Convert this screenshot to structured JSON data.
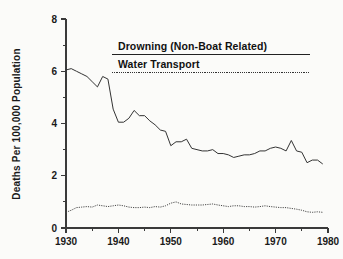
{
  "chart_data": {
    "type": "line",
    "title": "",
    "subtitle": "",
    "xlabel": "",
    "ylabel": "Deaths Per 100,000 Population",
    "xlim": [
      1930,
      1980
    ],
    "ylim": [
      0,
      8
    ],
    "grid": false,
    "legend_position": "upper-center",
    "x_ticks_major": [
      1930,
      1940,
      1950,
      1960,
      1970,
      1980
    ],
    "x_tick_labels": [
      "1930",
      "1940",
      "1950",
      "1960",
      "1970",
      "1980"
    ],
    "x_ticks_minor": [
      1935,
      1945,
      1955,
      1965,
      1975
    ],
    "y_ticks_major": [
      0,
      2,
      4,
      6,
      8
    ],
    "y_tick_labels": [
      "0",
      "2",
      "4",
      "6",
      "8"
    ],
    "y_ticks_minor": [
      1,
      3,
      5,
      7
    ],
    "x": [
      1930,
      1931,
      1932,
      1933,
      1934,
      1935,
      1936,
      1937,
      1938,
      1939,
      1940,
      1941,
      1942,
      1943,
      1944,
      1945,
      1946,
      1947,
      1948,
      1949,
      1950,
      1951,
      1952,
      1953,
      1954,
      1955,
      1956,
      1957,
      1958,
      1959,
      1960,
      1961,
      1962,
      1963,
      1964,
      1965,
      1966,
      1967,
      1968,
      1969,
      1970,
      1971,
      1972,
      1973,
      1974,
      1975,
      1976,
      1977,
      1978,
      1979
    ],
    "series": [
      {
        "name": "Drowning (Non-Boat Related)",
        "style": "solid",
        "color": "#333333",
        "values": [
          6.05,
          6.1,
          6.0,
          5.9,
          5.8,
          5.6,
          5.4,
          5.8,
          5.7,
          4.55,
          4.05,
          4.05,
          4.2,
          4.5,
          4.3,
          4.3,
          4.1,
          3.95,
          3.75,
          3.7,
          3.15,
          3.3,
          3.3,
          3.4,
          3.05,
          3.0,
          2.95,
          2.95,
          3.0,
          2.85,
          2.85,
          2.8,
          2.7,
          2.75,
          2.8,
          2.8,
          2.85,
          2.95,
          2.95,
          3.05,
          3.1,
          3.05,
          2.95,
          3.35,
          2.95,
          2.9,
          2.5,
          2.6,
          2.6,
          2.45
        ]
      },
      {
        "name": "Water Transport",
        "style": "dotted",
        "color": "#444444",
        "values": [
          0.6,
          0.68,
          0.78,
          0.8,
          0.82,
          0.8,
          0.88,
          0.85,
          0.82,
          0.85,
          0.88,
          0.85,
          0.8,
          0.78,
          0.78,
          0.8,
          0.78,
          0.82,
          0.8,
          0.85,
          0.95,
          1.0,
          0.92,
          0.9,
          0.88,
          0.88,
          0.88,
          0.9,
          0.92,
          0.88,
          0.85,
          0.82,
          0.85,
          0.85,
          0.82,
          0.82,
          0.8,
          0.82,
          0.85,
          0.82,
          0.8,
          0.78,
          0.78,
          0.75,
          0.72,
          0.68,
          0.62,
          0.6,
          0.62,
          0.6
        ]
      }
    ],
    "legend": [
      {
        "label": "Drowning (Non-Boat Related)",
        "style": "solid"
      },
      {
        "label": "Water Transport",
        "style": "dotted"
      }
    ]
  }
}
